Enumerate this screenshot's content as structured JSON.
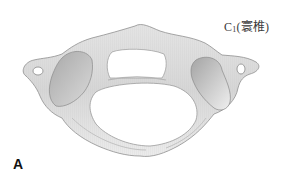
{
  "figure": {
    "label": {
      "prefix": "C",
      "subscript": "1",
      "text": "(寰椎)"
    },
    "panel_letter": "A",
    "colors": {
      "bone_light": "#ececec",
      "bone_mid": "#cfcfcf",
      "bone_dark": "#9a9a9a",
      "outline": "#8a8a8a",
      "background": "#ffffff"
    }
  }
}
